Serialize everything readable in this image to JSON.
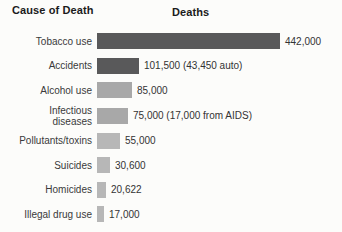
{
  "header": {
    "left_title": "Cause of Death",
    "right_title": "Deaths"
  },
  "chart_data": {
    "type": "bar",
    "orientation": "horizontal",
    "title": "Deaths",
    "xlabel": "Cause of Death",
    "ylabel": "Deaths",
    "grid": false,
    "legend": false,
    "max_value": 442000,
    "max_bar_px": 183,
    "categories": [
      "Tobacco use",
      "Accidents",
      "Alcohol use",
      "Infectious\ndiseases",
      "Pollutants/toxins",
      "Suicides",
      "Homicides",
      "Illegal drug use"
    ],
    "values": [
      442000,
      101500,
      85000,
      75000,
      55000,
      30600,
      20622,
      17000
    ],
    "value_labels": [
      "442,000",
      "101,500 (43,450 auto)",
      "85,000",
      "75,000 (17,000 from AIDS)",
      "55,000",
      "30,600",
      "20,622",
      "17,000"
    ],
    "bar_colors": [
      "#59595a",
      "#59595a",
      "#a8a8a8",
      "#a8a8a8",
      "#b7b7b7",
      "#b7b7b7",
      "#b7b7b7",
      "#b7b7b7"
    ],
    "tall_row_index": 3
  },
  "colors": {
    "background": "#fcfcfa",
    "dark_bar": "#59595a",
    "mid_bar": "#a8a8a8",
    "light_bar": "#b7b7b7",
    "header_text": "#1b1b1b",
    "label_text": "#3a3a3a"
  }
}
